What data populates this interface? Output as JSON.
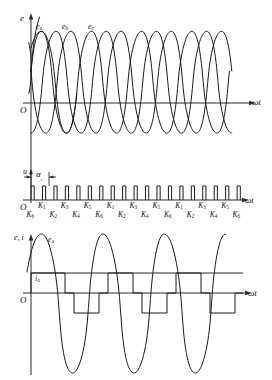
{
  "figure": {
    "background_color": "#ffffff",
    "line_color": "#1a1a1a",
    "axis_color": "#2b2b2b"
  },
  "panel_top": {
    "y_axis_label": "e",
    "x_axis_label": "ωt",
    "origin_label": "O",
    "phase_labels": [
      "e",
      "e",
      "e"
    ],
    "phase_subscripts": [
      "a",
      "b",
      "c"
    ]
  },
  "panel_middle": {
    "y_axis_label": "u",
    "x_axis_label": "ωt",
    "origin_label": "O",
    "angle_label": "α",
    "pulse_count": 19,
    "upper_switch_labels": [
      "K",
      "K",
      "K",
      "K",
      "K",
      "K",
      "K",
      "K",
      "K"
    ],
    "upper_switch_subscripts": [
      "1",
      "3",
      "5",
      "1",
      "3",
      "5",
      "1",
      "3",
      "5"
    ],
    "lower_switch_labels": [
      "K",
      "K",
      "K",
      "K",
      "K",
      "K",
      "K",
      "K",
      "K",
      "K"
    ],
    "lower_switch_subscripts": [
      "6",
      "2",
      "4",
      "6",
      "2",
      "4",
      "6",
      "2",
      "4",
      "6"
    ]
  },
  "panel_bottom": {
    "y_axis_label": "e, i",
    "x_axis_label": "ωt",
    "origin_label": "O",
    "emf_label": "e",
    "emf_subscript": "a",
    "current_label": "i",
    "current_subscript": "a"
  },
  "chart_data": {
    "type": "line",
    "xlabel": "ωt",
    "panels": [
      {
        "name": "three-phase-emf",
        "ylabel": "e",
        "xlabel": "ωt",
        "x_range_deg": [
          0,
          1080
        ],
        "ylim": [
          -1.1,
          1.1
        ],
        "grid": false,
        "series": [
          {
            "name": "e_a",
            "type": "sine",
            "amplitude": 1.0,
            "phase_deg": 30,
            "period_deg": 120
          },
          {
            "name": "e_b",
            "type": "sine",
            "amplitude": 1.0,
            "phase_deg": -90,
            "period_deg": 120
          },
          {
            "name": "e_c",
            "type": "sine",
            "amplitude": 1.0,
            "phase_deg": 150,
            "period_deg": 120
          }
        ],
        "annotations": [
          "e_a",
          "e_b",
          "e_c"
        ]
      },
      {
        "name": "gate-trigger-pulses",
        "ylabel": "u",
        "xlabel": "ωt",
        "ylim": [
          0,
          1
        ],
        "grid": false,
        "type": "pulse-train",
        "pulse_count": 19,
        "pulse_spacing_deg": 60,
        "pulse_width_deg": 12,
        "firing_angle_label": "α",
        "switch_sequence": [
          "K6",
          "K1",
          "K2",
          "K3",
          "K4",
          "K5",
          "K6",
          "K1",
          "K2",
          "K3",
          "K4",
          "K5",
          "K6",
          "K1",
          "K2",
          "K3",
          "K4",
          "K5",
          "K6"
        ]
      },
      {
        "name": "phase-emf-and-current",
        "ylabel": "e, i",
        "xlabel": "ωt",
        "ylim": [
          -1.2,
          1.2
        ],
        "grid": false,
        "series": [
          {
            "name": "e_a",
            "type": "sine",
            "amplitude": 1.0,
            "phase_deg": 0,
            "period_deg": 360
          },
          {
            "name": "i_a",
            "type": "quasi-square",
            "amplitude": 0.42,
            "conduction_deg": 120,
            "gap_deg": 60
          }
        ],
        "annotations": [
          "e_a",
          "i_a"
        ]
      }
    ]
  }
}
